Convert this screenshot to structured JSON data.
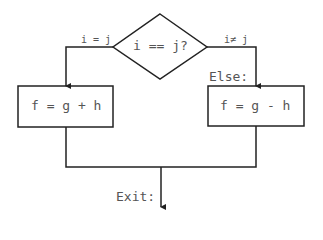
{
  "diagram": {
    "type": "flowchart",
    "decision": {
      "label": "i == j?"
    },
    "branches": {
      "true_label": "i = j",
      "false_label": "i≠ j",
      "else_label": "Else:"
    },
    "boxes": {
      "left": {
        "label": "f = g + h"
      },
      "right": {
        "label": "f = g - h"
      }
    },
    "exit_label": "Exit:",
    "colors": {
      "stroke": "#222222",
      "text": "#555555"
    }
  }
}
